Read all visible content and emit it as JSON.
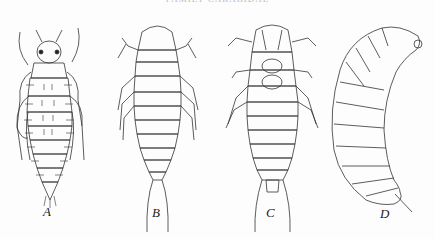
{
  "header": {
    "running_title": "FAMILY CARABIDAE"
  },
  "figures": [
    {
      "label": "A",
      "description": "Larva, dorsal view, setose campodeiform"
    },
    {
      "label": "B",
      "description": "Larva, dorsal view, with elongate terminal process"
    },
    {
      "label": "C",
      "description": "Larva, ventral view, with elongate terminal process"
    },
    {
      "label": "D",
      "description": "Larva, lateral view, curved scarabaeiform"
    }
  ]
}
